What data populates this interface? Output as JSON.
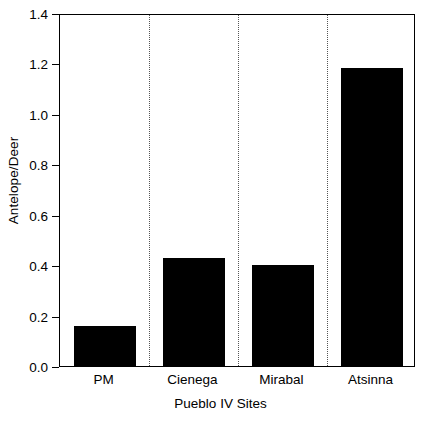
{
  "chart_data": {
    "type": "bar",
    "title": "",
    "subtitle": "",
    "xlabel": "Pueblo IV Sites",
    "ylabel": "Antelope/Deer",
    "categories": [
      "PM",
      "Cienega",
      "Mirabal",
      "Atsinna"
    ],
    "values": [
      0.16,
      0.43,
      0.4,
      1.18
    ],
    "ylim": [
      0.0,
      1.4
    ],
    "ytick_labels": [
      "0.0",
      "0.2",
      "0.4",
      "0.6",
      "0.8",
      "1.0",
      "1.2",
      "1.4"
    ],
    "ytick_values": [
      0.0,
      0.2,
      0.4,
      0.6,
      0.8,
      1.0,
      1.2,
      1.4
    ],
    "grid": "vertical-dotted-category-separators",
    "legend": "none",
    "bar_color": "#000000",
    "background_color": "#ffffff",
    "axis_color": "#000000"
  }
}
